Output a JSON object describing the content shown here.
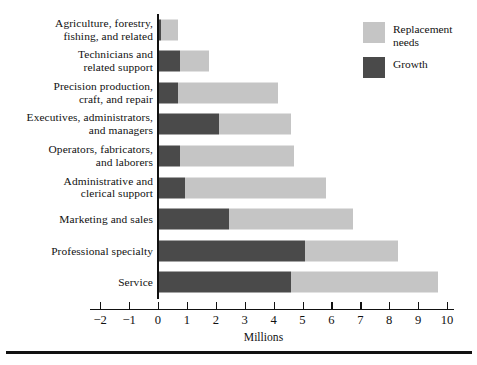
{
  "chart_data": {
    "type": "bar",
    "orientation": "horizontal",
    "stacked": true,
    "title": "",
    "xlabel": "Millions",
    "ylabel": "",
    "xlim": [
      -2,
      10
    ],
    "xticks": [
      -2,
      -1,
      0,
      1,
      2,
      3,
      4,
      5,
      6,
      7,
      8,
      9,
      10
    ],
    "xtick_labels": [
      "−2",
      "−1",
      "0",
      "1",
      "2",
      "3",
      "4",
      "5",
      "6",
      "7",
      "8",
      "9",
      "10"
    ],
    "grid": false,
    "legend_position": "top-right",
    "categories": [
      "Agriculture, forestry,\nfishing, and related",
      "Technicians and\nrelated support",
      "Precision production,\ncraft, and repair",
      "Executives, administrators,\nand managers",
      "Operators, fabricators,\nand laborers",
      "Administrative and\nclerical support",
      "Marketing and sales",
      "Professional specialty",
      "Service"
    ],
    "series": [
      {
        "name": "Growth",
        "color": "#4a4a4a",
        "values": [
          0.1,
          0.75,
          0.7,
          2.1,
          0.75,
          0.95,
          2.45,
          5.1,
          4.6
        ]
      },
      {
        "name": "Replacement needs",
        "color": "#c5c5c5",
        "values": [
          0.6,
          1.0,
          3.45,
          2.5,
          3.95,
          4.85,
          4.3,
          3.2,
          5.1
        ]
      }
    ],
    "totals": [
      0.7,
      1.75,
      4.15,
      4.6,
      4.7,
      5.8,
      6.75,
      8.3,
      9.7
    ]
  },
  "legend": {
    "items": [
      {
        "label": "Replacement\nneeds",
        "swatch": "replacement"
      },
      {
        "label": "Growth",
        "swatch": "growth"
      }
    ]
  }
}
